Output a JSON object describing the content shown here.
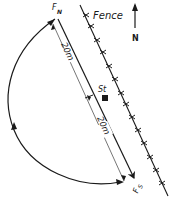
{
  "diagram": {
    "labels": {
      "fence": "Fence",
      "north": "N",
      "fn": "F",
      "fn_sub": "N",
      "fs": "F",
      "fs_sub": "S",
      "st": "St",
      "dist_upper": "20m",
      "dist_lower": "20m"
    },
    "colors": {
      "line": "#1a1a1a",
      "background": "#ffffff"
    },
    "elements": [
      {
        "id": "fence",
        "type": "fence-line-with-crosses"
      },
      {
        "id": "north-arrow",
        "type": "arrow",
        "direction": "up"
      },
      {
        "id": "fn-to-fs",
        "type": "arrow-line",
        "from": "F_N",
        "to": "F_S"
      },
      {
        "id": "dimension-line",
        "type": "dimension",
        "segments": [
          "20m",
          "20m"
        ]
      },
      {
        "id": "st-marker",
        "type": "square-marker",
        "label": "St"
      },
      {
        "id": "return-arc",
        "type": "curved-arrow-path",
        "from": "F_S-side",
        "to": "F_N",
        "note": "semicircular path on west side"
      }
    ]
  }
}
